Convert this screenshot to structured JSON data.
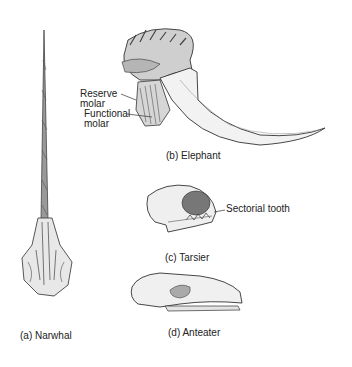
{
  "figure": {
    "panels": [
      {
        "id": "a",
        "caption": "(a) Narwhal"
      },
      {
        "id": "b",
        "caption": "(b) Elephant",
        "callouts": [
          "Reserve",
          "molar",
          "Functional",
          "molar"
        ]
      },
      {
        "id": "c",
        "caption": "(c) Tarsier",
        "callouts": [
          "Sectorial tooth"
        ]
      },
      {
        "id": "d",
        "caption": "(d) Anteater"
      }
    ]
  }
}
